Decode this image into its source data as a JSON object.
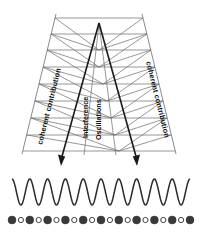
{
  "figure": {
    "background_color": "#ffffff",
    "labels": {
      "left": "coherent contribution",
      "right": "coherent contribution",
      "center_line1": "Interference",
      "center_line2": "Oscillations"
    },
    "colors": {
      "lattice": "#6b6b6b",
      "ray": "#1a1a1a",
      "wave": "#2b2b2b",
      "dot_filled": "#3a3a3a",
      "dot_hollow": "#ffffff",
      "text": "#111111"
    },
    "wave": {
      "periods": 10,
      "amplitude": 13,
      "baseline_y": 192,
      "x_start": 12,
      "x_end": 190
    },
    "dots": {
      "count": 21,
      "row_y": 220,
      "radius_filled": 4.0,
      "radius_hollow": 2.6,
      "pattern": [
        "filled",
        "hollow",
        "filled",
        "hollow",
        "filled",
        "hollow",
        "filled",
        "hollow",
        "filled",
        "hollow",
        "filled",
        "hollow",
        "filled",
        "hollow",
        "filled",
        "hollow",
        "filled",
        "hollow",
        "filled",
        "hollow",
        "filled"
      ]
    },
    "arrows": {
      "left_label": "down-left-ray-arrow",
      "right_label": "down-right-ray-arrow",
      "count": 2
    },
    "lattice": {
      "rows": 9,
      "description": "trapezoidal grid of crossing diagonal lines"
    }
  }
}
